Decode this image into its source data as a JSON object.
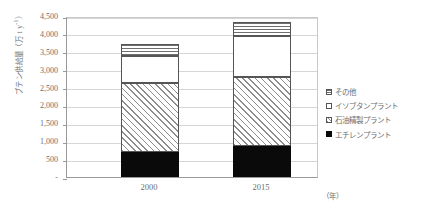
{
  "chart_data": {
    "type": "bar",
    "stacked": true,
    "title": "",
    "xlabel": "(年)",
    "ylabel": "ブテン供給量 (万 t y-1)",
    "ylabel_main": "ブテン供給量（万 t y",
    "ylabel_exponent": "-1",
    "ylabel_tail": "）",
    "categories": [
      "2000",
      "2015"
    ],
    "ylim": [
      0,
      4500
    ],
    "yticks": [
      0,
      500,
      1000,
      1500,
      2000,
      2500,
      3000,
      3500,
      4000,
      4500
    ],
    "ytick_labels": [
      "-",
      "500",
      "1,000",
      "1,500",
      "2,000",
      "2,500",
      "3,000",
      "3,500",
      "4,000",
      "4,500"
    ],
    "grid": true,
    "legend_position": "right",
    "series": [
      {
        "name": "エチレンプラント",
        "pattern": "solid-black",
        "color": "#0a0a0a",
        "values": [
          700,
          880
        ]
      },
      {
        "name": "石油精製プラント",
        "pattern": "diagonal-hatch",
        "color": "#8d8d8d",
        "values": [
          1930,
          1920
        ]
      },
      {
        "name": "イソブタンプラント",
        "pattern": "white",
        "color": "#ffffff",
        "values": [
          740,
          1130
        ]
      },
      {
        "name": "その他",
        "pattern": "horizontal-lines",
        "color": "#6f6f6f",
        "values": [
          350,
          390
        ]
      }
    ],
    "totals": [
      3720,
      4320
    ]
  },
  "axis": {
    "y_title_prefix": "ブテン供給量（万 t y",
    "y_title_exp": "-1",
    "y_title_suffix": "）",
    "x_unit": "（年）"
  },
  "legend": {
    "items": [
      {
        "label": "その他",
        "key": "other"
      },
      {
        "label": "イソブタンプラント",
        "key": "isobutane"
      },
      {
        "label": "石油精製プラント",
        "key": "refinery"
      },
      {
        "label": "エチレンプラント",
        "key": "ethylene"
      }
    ]
  }
}
